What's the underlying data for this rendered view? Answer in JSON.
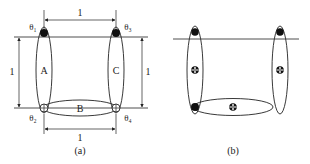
{
  "panel_a": {
    "caption": "(a)",
    "ellipses": [
      {
        "label": "A"
      },
      {
        "label": "B"
      },
      {
        "label": "C"
      }
    ],
    "angles": [
      {
        "label": "θ₁"
      },
      {
        "label": "θ₂"
      },
      {
        "label": "θ₃"
      },
      {
        "label": "θ₄"
      }
    ],
    "dimensions": {
      "top": "1",
      "bottom": "1",
      "left": "1",
      "right": "1"
    }
  },
  "panel_b": {
    "caption": "(b)"
  },
  "colors": {
    "stroke": "#222222",
    "background": "#ffffff"
  }
}
